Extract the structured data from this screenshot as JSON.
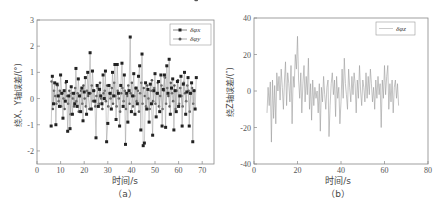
{
  "chart_data": [
    {
      "id": "a",
      "type": "line",
      "caption": "（a）",
      "xlabel": "时间/s",
      "ylabel": "绕X、Y轴误差/(°)",
      "xlim": [
        0,
        75
      ],
      "ylim": [
        -2.5,
        3
      ],
      "xticks": [
        0,
        10,
        20,
        30,
        40,
        50,
        60,
        70
      ],
      "yticks": [
        -2,
        -1,
        0,
        1,
        2,
        3
      ],
      "grid": false,
      "legend_position": "upper right",
      "series": [
        {
          "name": "δφx",
          "marker": "square",
          "color": "#222222",
          "x": [
            6,
            6.5,
            7,
            7.5,
            8,
            8.5,
            9,
            9.5,
            10,
            10.5,
            11,
            11.5,
            12,
            12.5,
            13,
            13.5,
            14,
            14.5,
            15,
            15.5,
            16,
            16.5,
            17,
            17.5,
            18,
            18.5,
            19,
            19.5,
            20,
            20.5,
            21,
            21.5,
            22,
            22.5,
            23,
            23.5,
            24,
            24.5,
            25,
            25.5,
            26,
            26.5,
            27,
            27.5,
            28,
            28.5,
            29,
            29.5,
            30,
            30.5,
            31,
            31.5,
            32,
            32.5,
            33,
            33.5,
            34,
            34.5,
            35,
            35.5,
            36,
            36.5,
            37,
            37.5,
            38,
            38.5,
            39,
            39.5,
            40,
            40.5,
            41,
            41.5,
            42,
            42.5,
            43,
            43.5,
            44,
            44.5,
            45,
            45.5,
            46,
            46.5,
            47,
            47.5,
            48,
            48.5,
            49,
            49.5,
            50,
            50.5,
            51,
            51.5,
            52,
            52.5,
            53,
            53.5,
            54,
            54.5,
            55,
            55.5,
            56,
            56.5,
            57,
            57.5,
            58,
            58.5,
            59,
            59.5,
            60,
            60.5,
            61,
            61.5,
            62,
            62.5,
            63,
            63.5,
            64,
            64.5,
            65,
            65.5,
            66,
            66.5,
            67,
            67.5
          ],
          "values": [
            -1.05,
            0.85,
            -0.2,
            0.6,
            -1.0,
            0.55,
            0.1,
            -0.3,
            0.9,
            0.2,
            -0.75,
            0.3,
            -0.1,
            0.65,
            -1.25,
            0.1,
            -1.15,
            0.45,
            -0.6,
            0.2,
            -0.2,
            1.15,
            -0.3,
            0.75,
            0.1,
            -0.5,
            0.4,
            -0.85,
            0.25,
            0.8,
            -0.6,
            1.0,
            0.2,
            1.75,
            -0.4,
            1.05,
            0.3,
            -0.1,
            -1.5,
            0.5,
            -0.3,
            0.35,
            0.1,
            -0.2,
            0.9,
            0.0,
            1.05,
            -1.65,
            -0.95,
            0.5,
            0.2,
            -0.4,
            1.0,
            0.1,
            1.3,
            -0.8,
            1.3,
            0.2,
            -1.05,
            0.5,
            1.35,
            -0.3,
            0.9,
            -1.75,
            0.2,
            -0.9,
            0.3,
            2.35,
            -0.5,
            0.1,
            0.95,
            -0.6,
            0.4,
            -0.2,
            0.85,
            1.25,
            -1.2,
            1.7,
            -1.8,
            -1.7,
            0.6,
            -0.4,
            0.35,
            -0.9,
            0.55,
            -0.2,
            -1.4,
            0.3,
            0.95,
            -0.7,
            0.2,
            0.65,
            -0.5,
            0.9,
            -1.05,
            0.35,
            0.9,
            -1.1,
            1.25,
            0.2,
            1.5,
            -0.6,
            0.4,
            0.75,
            -1.2,
            0.3,
            -0.5,
            0.65,
            -0.3,
            0.1,
            0.85,
            -1.05,
            0.55,
            1.0,
            -0.6,
            0.25,
            0.8,
            -1.05,
            0.2,
            0.6,
            -1.65,
            0.3,
            -0.4,
            0.8
          ]
        },
        {
          "name": "δφy",
          "marker": "circle",
          "color": "#555555",
          "x": [
            6.2,
            6.7,
            7.2,
            7.7,
            8.2,
            8.7,
            9.2,
            9.7,
            10.2,
            10.7,
            11.2,
            11.7,
            12.2,
            12.7,
            13.2,
            13.7,
            14.2,
            14.7,
            15.2,
            15.7,
            16.2,
            16.7,
            17.2,
            17.7,
            18.2,
            18.7,
            19.2,
            19.7,
            20.2,
            20.7,
            21.2,
            21.7,
            22.2,
            22.7,
            23.2,
            23.7,
            24.2,
            24.7,
            25.2,
            25.7,
            26.2,
            26.7,
            27.2,
            27.7,
            28.2,
            28.7,
            29.2,
            29.7,
            30.2,
            30.7,
            31.2,
            31.7,
            32.2,
            32.7,
            33.2,
            33.7,
            34.2,
            34.7,
            35.2,
            35.7,
            36.2,
            36.7,
            37.2,
            37.7,
            38.2,
            38.7,
            39.2,
            39.7,
            40.2,
            40.7,
            41.2,
            41.7,
            42.2,
            42.7,
            43.2,
            43.7,
            44.2,
            44.7,
            45.2,
            45.7,
            46.2,
            46.7,
            47.2,
            47.7,
            48.2,
            48.7,
            49.2,
            49.7,
            50.2,
            50.7,
            51.2,
            51.7,
            52.2,
            52.7,
            53.2,
            53.7,
            54.2,
            54.7,
            55.2,
            55.7,
            56.2,
            56.7,
            57.2,
            57.7,
            58.2,
            58.7,
            59.2,
            59.7,
            60.2,
            60.7,
            61.2,
            61.7,
            62.2,
            62.7,
            63.2,
            63.7,
            64.2,
            64.7,
            65.2,
            65.7,
            66.2,
            66.7,
            67.2,
            67.7
          ],
          "values": [
            0.65,
            -0.4,
            0.3,
            0.1,
            -0.2,
            0.5,
            -0.1,
            0.3,
            -0.3,
            0.2,
            0.0,
            -0.4,
            0.6,
            0.1,
            -0.2,
            0.3,
            -0.6,
            0.2,
            0.0,
            -0.3,
            0.4,
            -0.1,
            0.2,
            -0.5,
            0.1,
            0.3,
            -0.2,
            0.5,
            0.0,
            -0.3,
            0.3,
            0.1,
            -0.4,
            0.2,
            0.5,
            -0.1,
            0.3,
            -0.3,
            0.1,
            0.4,
            -0.2,
            0.6,
            0.0,
            -0.4,
            0.2,
            0.3,
            -0.1,
            0.5,
            -0.3,
            0.2,
            0.0,
            0.4,
            -0.2,
            0.6,
            0.1,
            -0.3,
            0.3,
            0.0,
            -0.5,
            0.2,
            0.4,
            -0.1,
            0.3,
            -0.4,
            0.1,
            0.5,
            -0.2,
            0.2,
            0.6,
            -0.3,
            0.1,
            0.4,
            -0.1,
            0.3,
            -0.5,
            0.2,
            0.6,
            -0.2,
            0.4,
            0.1,
            -0.3,
            0.5,
            0.0,
            -0.4,
            0.3,
            0.7,
            -0.1,
            0.4,
            -0.2,
            0.2,
            0.6,
            -0.3,
            0.1,
            0.5,
            -0.4,
            0.3,
            0.8,
            -0.2,
            0.4,
            0.1,
            -0.3,
            0.6,
            0.2,
            -0.1,
            0.5,
            -0.4,
            0.3,
            0.7,
            -0.2,
            0.4,
            0.1,
            -0.3,
            0.6,
            0.2,
            -0.1,
            0.5,
            0.3,
            -0.5,
            0.2,
            0.4,
            -0.2,
            0.3
          ]
        }
      ]
    },
    {
      "id": "b",
      "type": "line",
      "caption": "（b）",
      "xlabel": "时间/s",
      "ylabel": "绕Z轴误差/(″)",
      "xlim": [
        0,
        80
      ],
      "ylim": [
        -40,
        40
      ],
      "xticks": [
        0,
        20,
        40,
        60,
        80
      ],
      "yticks": [
        -40,
        -20,
        0,
        20,
        40
      ],
      "grid": false,
      "legend_position": "upper right",
      "series": [
        {
          "name": "δφz",
          "marker": "none",
          "color": "#9a9a9a",
          "x": [
            6,
            6.5,
            7,
            7.5,
            8,
            8.5,
            9,
            9.5,
            10,
            10.5,
            11,
            11.5,
            12,
            12.5,
            13,
            13.5,
            14,
            14.5,
            15,
            15.5,
            16,
            16.5,
            17,
            17.5,
            18,
            18.5,
            19,
            19.5,
            20,
            20.5,
            21,
            21.5,
            22,
            22.5,
            23,
            23.5,
            24,
            24.5,
            25,
            25.5,
            26,
            26.5,
            27,
            27.5,
            28,
            28.5,
            29,
            29.5,
            30,
            30.5,
            31,
            31.5,
            32,
            32.5,
            33,
            33.5,
            34,
            34.5,
            35,
            35.5,
            36,
            36.5,
            37,
            37.5,
            38,
            38.5,
            39,
            39.5,
            40,
            40.5,
            41,
            41.5,
            42,
            42.5,
            43,
            43.5,
            44,
            44.5,
            45,
            45.5,
            46,
            46.5,
            47,
            47.5,
            48,
            48.5,
            49,
            49.5,
            50,
            50.5,
            51,
            51.5,
            52,
            52.5,
            53,
            53.5,
            54,
            54.5,
            55,
            55.5,
            56,
            56.5,
            57,
            57.5,
            58,
            58.5,
            59,
            59.5,
            60,
            60.5,
            61,
            61.5,
            62,
            62.5,
            63,
            63.5,
            64,
            64.5,
            65,
            65.5,
            66,
            66.5,
            67,
            67.5
          ],
          "values": [
            -12,
            2,
            -8,
            5,
            -28,
            6,
            -15,
            3,
            -18,
            10,
            0,
            8,
            -5,
            12,
            2,
            -10,
            6,
            16,
            -8,
            10,
            4,
            -6,
            14,
            -18,
            8,
            2,
            20,
            12,
            30,
            6,
            -4,
            10,
            -12,
            4,
            14,
            -6,
            8,
            -2,
            18,
            -10,
            4,
            -16,
            6,
            -8,
            2,
            -4,
            0,
            -12,
            4,
            -22,
            2,
            -6,
            8,
            -2,
            -10,
            2,
            6,
            -25,
            -8,
            4,
            10,
            -2,
            6,
            -14,
            8,
            -4,
            2,
            -18,
            -6,
            12,
            -4,
            18,
            4,
            -2,
            -10,
            12,
            2,
            -6,
            8,
            -2,
            10,
            4,
            -12,
            6,
            -4,
            14,
            0,
            -8,
            6,
            2,
            -6,
            10,
            -4,
            8,
            -2,
            12,
            4,
            -6,
            2,
            -10,
            6,
            -4,
            8,
            -2,
            4,
            -20,
            6,
            -4,
            14,
            -2,
            8,
            14,
            -10,
            4,
            -6,
            6,
            -12,
            2,
            6,
            -4,
            4,
            -8
          ],
          "yvalues_note": ""
        }
      ]
    }
  ],
  "legend_a": {
    "item1": "δφx",
    "item2": "δφy"
  },
  "legend_b": {
    "item1": "δφz"
  },
  "labels": {
    "a_xlabel": "时间/s",
    "a_ylabel": "绕X、Y轴误差/(°)",
    "a_caption": "（a）",
    "b_xlabel": "时间/s",
    "b_ylabel": "绕Z轴误差/(″)",
    "b_caption": "（b）"
  }
}
